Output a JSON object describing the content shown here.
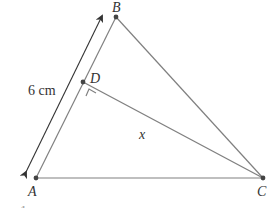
{
  "diagram": {
    "type": "geometry-triangle",
    "points": [
      {
        "id": "A",
        "label": "A",
        "x": 36,
        "y": 178
      },
      {
        "id": "B",
        "label": "B",
        "x": 116,
        "y": 17
      },
      {
        "id": "C",
        "label": "C",
        "x": 263,
        "y": 178
      },
      {
        "id": "D",
        "label": "D",
        "x": 83,
        "y": 82
      }
    ],
    "segments": [
      {
        "from": "A",
        "to": "B"
      },
      {
        "from": "B",
        "to": "C"
      },
      {
        "from": "A",
        "to": "C"
      },
      {
        "from": "D",
        "to": "C",
        "label": "x"
      }
    ],
    "right_angle_at": "D",
    "dimension": {
      "along": "AB",
      "label": "6 cm",
      "double_arrow": true
    },
    "labels": {
      "A": "A",
      "B": "B",
      "C": "C",
      "D": "D",
      "x": "x",
      "length_ab": "6 cm"
    },
    "colors": {
      "edge": "#808080",
      "point": "#444444",
      "text": "#333333"
    },
    "cut_off_text": "… 1 …"
  }
}
